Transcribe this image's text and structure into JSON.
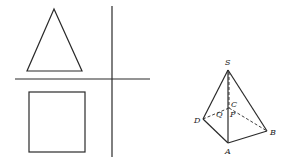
{
  "figure": {
    "left_panel": {
      "description": "three-view projection: triangle (front view), square (top view), with cross axes",
      "shapes": [
        "triangle",
        "square"
      ]
    },
    "right_panel": {
      "description": "square pyramid S-ABCD with interior points",
      "labels": {
        "S": "S",
        "A": "A",
        "B": "B",
        "C": "C",
        "D": "D",
        "P": "P",
        "Q": "Q"
      }
    },
    "colors": {
      "stroke": "#2a2a2a",
      "background": "#ffffff"
    }
  }
}
